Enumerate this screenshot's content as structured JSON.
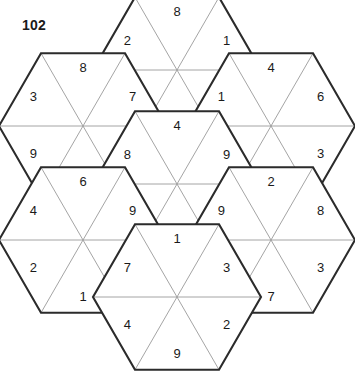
{
  "puzzle": {
    "number": "102",
    "type": "hexagon-triangle-number-puzzle",
    "hexagon_count": 7,
    "cells_per_hexagon": 6,
    "colors": {
      "background": "#ffffff",
      "hexagon_outline": "#2b2b2b",
      "triangle_outline": "#9a9a9a",
      "digit": "#1a1a1a"
    },
    "geometry": {
      "center_x": 177,
      "center_y": 184,
      "hex_radius": 84,
      "note": "flat-top hexagons, each split into 6 triangles by its 3 long diagonals"
    },
    "hexagons": [
      {
        "name": "top",
        "cx": 177,
        "cy": 70,
        "values": [
          "1",
          "6",
          "4",
          "9",
          "2",
          "8"
        ],
        "order": "clockwise from top-right-upper triangle"
      },
      {
        "name": "upper-left",
        "cx": 83,
        "cy": 126,
        "values": [
          "7",
          "2",
          "4",
          "9",
          "3",
          "8"
        ],
        "order": "clockwise from top-right-upper triangle"
      },
      {
        "name": "upper-right",
        "cx": 271,
        "cy": 126,
        "values": [
          "6",
          "3",
          "7",
          "8",
          "1",
          "4"
        ],
        "order": "clockwise from top-right-upper triangle"
      },
      {
        "name": "center",
        "cx": 177,
        "cy": 184,
        "values": [
          "9",
          "1",
          "2",
          "3",
          "8",
          "4"
        ],
        "order": "clockwise from top-right-upper triangle"
      },
      {
        "name": "lower-left",
        "cx": 83,
        "cy": 240,
        "values": [
          "9",
          "8",
          "1",
          "2",
          "4",
          "6"
        ],
        "order": "clockwise from top-right-upper triangle"
      },
      {
        "name": "lower-right",
        "cx": 271,
        "cy": 240,
        "values": [
          "8",
          "3",
          "7",
          "6",
          "9",
          "2"
        ],
        "order": "clockwise from top-right-upper triangle"
      },
      {
        "name": "bottom",
        "cx": 177,
        "cy": 297,
        "values": [
          "3",
          "2",
          "9",
          "4",
          "7",
          "1"
        ],
        "order": "clockwise from top-right-upper triangle"
      }
    ]
  }
}
